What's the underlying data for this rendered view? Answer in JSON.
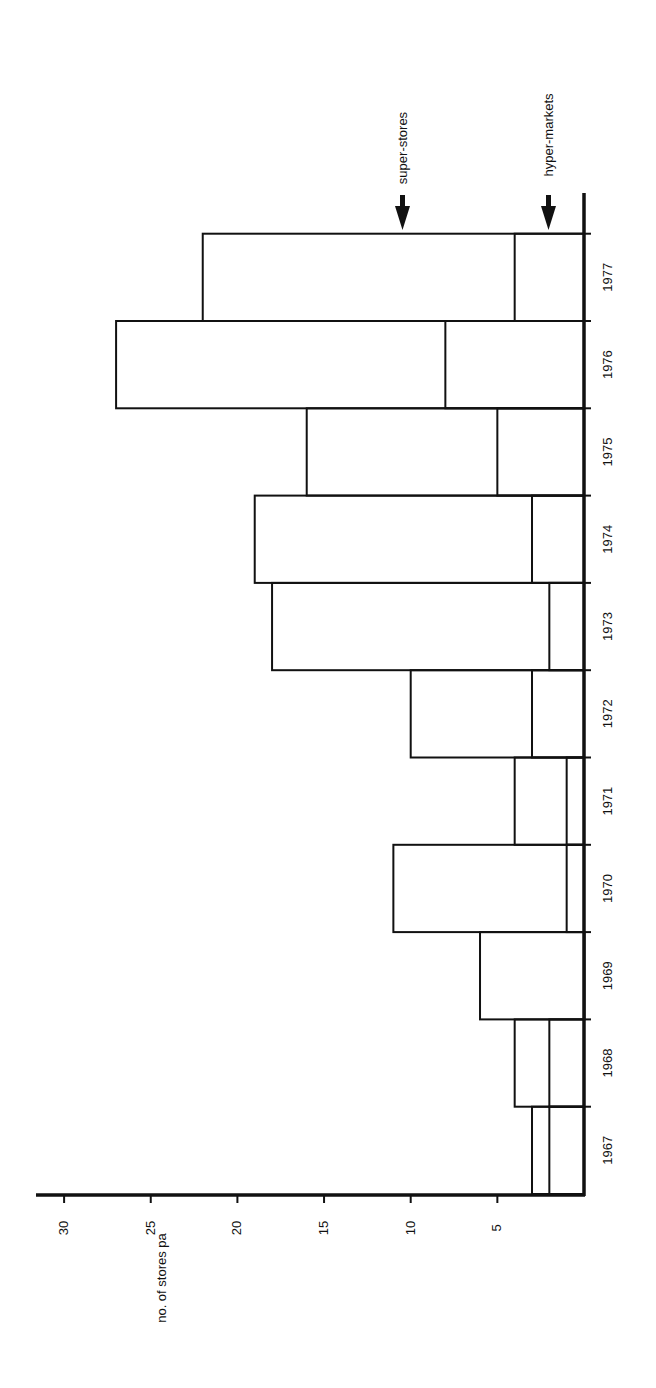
{
  "chart_data": {
    "type": "bar",
    "orientation": "rotated-90-ccw",
    "stacked": false,
    "overlay": true,
    "title": "",
    "xlabel": "",
    "ylabel": "no. of stores pa",
    "ylim": [
      0,
      30
    ],
    "yticks": [
      5,
      10,
      15,
      20,
      25,
      30
    ],
    "grid": false,
    "categories": [
      "1967",
      "1968",
      "1969",
      "1970",
      "1971",
      "1972",
      "1973",
      "1974",
      "1975",
      "1976",
      "1977"
    ],
    "series": [
      {
        "name": "super-stores",
        "values": [
          3,
          4,
          6,
          11,
          4,
          10,
          18,
          19,
          16,
          27,
          22
        ]
      },
      {
        "name": "hyper-markets",
        "values": [
          2,
          2,
          0,
          1,
          1,
          3,
          2,
          3,
          5,
          8,
          4
        ]
      }
    ],
    "annotations": [
      {
        "text": "super-stores",
        "arrow": "down",
        "points_to_series": "super-stores"
      },
      {
        "text": "hyper-markets",
        "arrow": "down",
        "points_to_series": "hyper-markets"
      }
    ],
    "colors": {
      "ink": "#111111",
      "background": "#ffffff"
    }
  }
}
